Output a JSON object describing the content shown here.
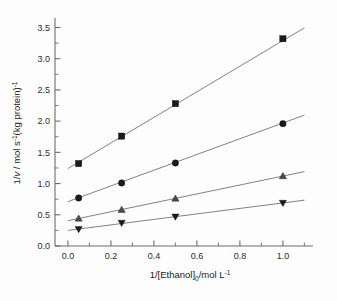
{
  "chart_data": {
    "type": "scatter",
    "title": "",
    "subtitle": "",
    "xlabel": "1/[Ethanol]0/mol L-1",
    "xlabel_parts": {
      "pre": "1/[Ethanol]",
      "sub": "0",
      "mid": "/mol L",
      "sup": "-1"
    },
    "ylabel": "1/v / mol s-1(kg protein)-1",
    "ylabel_parts": {
      "pre": "1/",
      "italic": "v",
      "mid1": " / mol s",
      "sup1": "-1",
      "mid2": "(kg protein)",
      "sup2": "-1"
    },
    "xlim": [
      -0.06,
      1.14
    ],
    "ylim": [
      0.0,
      3.62
    ],
    "xticks": [
      0.0,
      0.2,
      0.4,
      0.6,
      0.8,
      1.0
    ],
    "xticklabels": [
      "0.0",
      "0.2",
      "0.4",
      "0.6",
      "0.8",
      "1.0"
    ],
    "xminorticks": [
      0.1,
      0.3,
      0.5,
      0.7,
      0.9,
      1.1
    ],
    "yticks": [
      0.0,
      0.5,
      1.0,
      1.5,
      2.0,
      2.5,
      3.0,
      3.5
    ],
    "yticklabels": [
      "0.0",
      "0.5",
      "1.0",
      "1.5",
      "2.0",
      "2.5",
      "3.0",
      "3.5"
    ],
    "yminorticks": [
      0.25,
      0.75,
      1.25,
      1.75,
      2.25,
      2.75,
      3.25
    ],
    "grid": false,
    "legend": "none",
    "axes_shown": [
      "left",
      "bottom"
    ],
    "x": [
      0.05,
      0.25,
      0.5,
      1.0
    ],
    "series": [
      {
        "name": "series-1",
        "marker": "square",
        "color": "#1b1b1b",
        "values": [
          1.32,
          1.76,
          2.28,
          3.32
        ],
        "fit": {
          "intercept": 1.24,
          "slope": 2.05,
          "x_start": 0.0,
          "x_end": 1.1
        }
      },
      {
        "name": "series-2",
        "marker": "circle",
        "color": "#1b1b1b",
        "values": [
          0.77,
          1.01,
          1.33,
          1.96
        ],
        "fit": {
          "intercept": 0.71,
          "slope": 1.26,
          "x_start": 0.0,
          "x_end": 1.1
        }
      },
      {
        "name": "series-3",
        "marker": "triangle-up",
        "color": "#4a4a4a",
        "values": [
          0.44,
          0.58,
          0.76,
          1.12
        ],
        "fit": {
          "intercept": 0.405,
          "slope": 0.715,
          "x_start": 0.0,
          "x_end": 1.1
        }
      },
      {
        "name": "series-4",
        "marker": "triangle-down",
        "color": "#1b1b1b",
        "values": [
          0.27,
          0.37,
          0.47,
          0.69
        ],
        "fit": {
          "intercept": 0.25,
          "slope": 0.44,
          "x_start": 0.0,
          "x_end": 1.1
        }
      }
    ]
  }
}
